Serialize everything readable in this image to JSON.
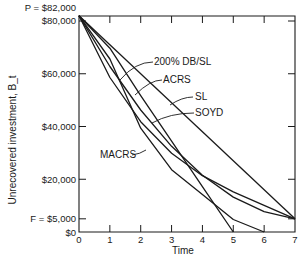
{
  "chart_data": {
    "type": "line",
    "title": "",
    "xlabel": "Time",
    "ylabel": "Unrecovered investment, B_t",
    "xlim": [
      0,
      7
    ],
    "ylim": [
      0,
      82000
    ],
    "grid": false,
    "x_ticks": [
      "0",
      "1",
      "2",
      "3",
      "4",
      "5",
      "6",
      "7"
    ],
    "y_ticks": [
      {
        "value": 82000,
        "label": "P = $82,000",
        "tick": false
      },
      {
        "value": 80000,
        "label": "$80,000",
        "tick": true
      },
      {
        "value": 60000,
        "label": "$60,000",
        "tick": true
      },
      {
        "value": 40000,
        "label": "$40,000",
        "tick": true
      },
      {
        "value": 20000,
        "label": "$20,000",
        "tick": true
      },
      {
        "value": 5000,
        "label": "F = $5,000",
        "tick": true
      },
      {
        "value": 0,
        "label": "$0",
        "tick": false
      }
    ],
    "series": [
      {
        "name": "200% DB/SL",
        "x": [
          0,
          1,
          2,
          3,
          4,
          5,
          6,
          7
        ],
        "values": [
          82000,
          58571,
          41837,
          29883,
          21345,
          15230,
          10115,
          5000
        ]
      },
      {
        "name": "ACRS",
        "x": [
          0,
          1,
          2,
          3,
          4,
          5
        ],
        "values": [
          82000,
          69700,
          51660,
          34440,
          17220,
          0
        ]
      },
      {
        "name": "SL",
        "x": [
          0,
          7
        ],
        "values": [
          82000,
          5000
        ]
      },
      {
        "name": "SOYD",
        "x": [
          0,
          1,
          2,
          3,
          4,
          5,
          6,
          7
        ],
        "values": [
          82000,
          62750,
          46250,
          32500,
          21500,
          13250,
          7750,
          5000
        ]
      },
      {
        "name": "MACRS",
        "x": [
          0,
          1,
          2,
          3,
          4,
          5,
          6
        ],
        "values": [
          82000,
          65600,
          39360,
          23616,
          14170,
          4723,
          0
        ]
      }
    ],
    "annotations": [
      {
        "text": "200% DB/SL",
        "points_to": "200% DB/SL"
      },
      {
        "text": "ACRS",
        "points_to": "ACRS"
      },
      {
        "text": "SL",
        "points_to": "SL"
      },
      {
        "text": "SOYD",
        "points_to": "SOYD"
      },
      {
        "text": "MACRS",
        "points_to": "MACRS"
      }
    ]
  },
  "style": {
    "line_color": "#1a1a1a",
    "background": "#ffffff"
  }
}
